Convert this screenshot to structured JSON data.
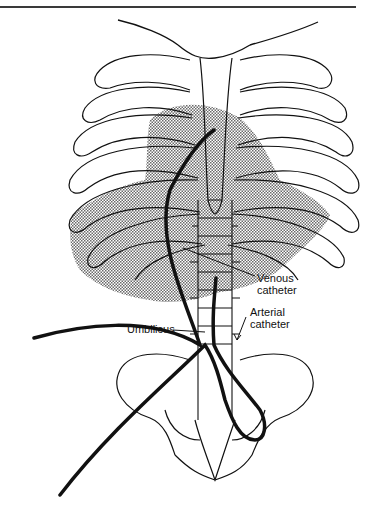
{
  "figure": {
    "labels": {
      "venous": "Venous\ncatheter",
      "venous_line1": "Venous",
      "venous_line2": "catheter",
      "arterial_line1": "Arterial",
      "arterial_line2": "catheter",
      "umbilicus": "Umbilicus"
    },
    "colors": {
      "line": "#111111",
      "shading": "#9a9a9a",
      "rule": "#3a3a3a"
    }
  }
}
